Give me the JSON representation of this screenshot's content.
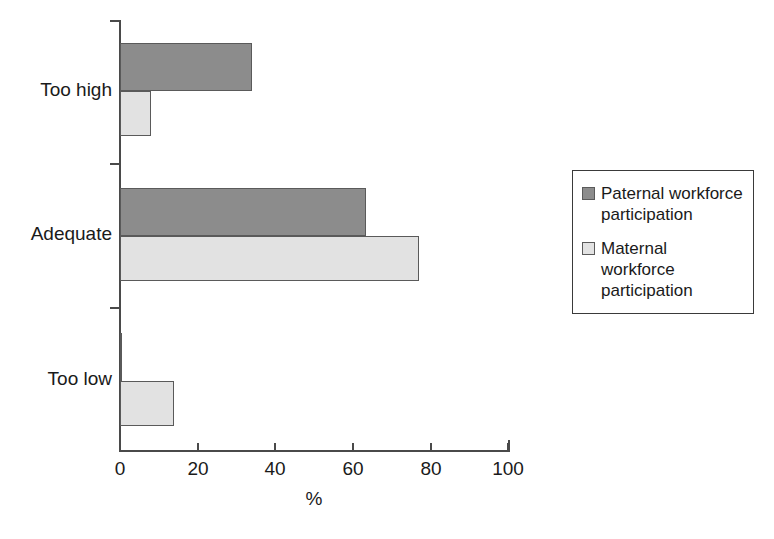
{
  "chart_data": {
    "type": "bar",
    "orientation": "horizontal",
    "title": "",
    "xlabel": "%",
    "ylabel": "",
    "xlim": [
      0,
      100
    ],
    "xticks": [
      0,
      20,
      40,
      60,
      80,
      100
    ],
    "xtick_labels": [
      "0",
      "20",
      "40",
      "60",
      "80",
      "100"
    ],
    "grid": false,
    "legend_position": "right",
    "categories": [
      "Too high",
      "Adequate",
      "Too low"
    ],
    "series": [
      {
        "name": "Paternal workforce participation",
        "color": "#8c8c8c",
        "values": [
          34,
          63.5,
          0.5
        ]
      },
      {
        "name": "Maternal workforce participation",
        "color": "#e2e2e2",
        "values": [
          8,
          77,
          14
        ]
      }
    ]
  },
  "axis": {
    "x_title": "%",
    "tick_labels": [
      "0",
      "20",
      "40",
      "60",
      "80",
      "100"
    ]
  },
  "categories": [
    {
      "label": "Too high"
    },
    {
      "label": "Adequate"
    },
    {
      "label": "Too low"
    }
  ],
  "legend": {
    "items": [
      {
        "label": "Paternal workforce participation",
        "color": "#8c8c8c"
      },
      {
        "label": "Maternal workforce participation",
        "color": "#e2e2e2"
      }
    ]
  },
  "colors": {
    "paternal": "#8c8c8c",
    "maternal": "#e2e2e2",
    "axis": "#4a4a4a",
    "bar_outline": "#5a5a5a",
    "background": "#ffffff"
  }
}
